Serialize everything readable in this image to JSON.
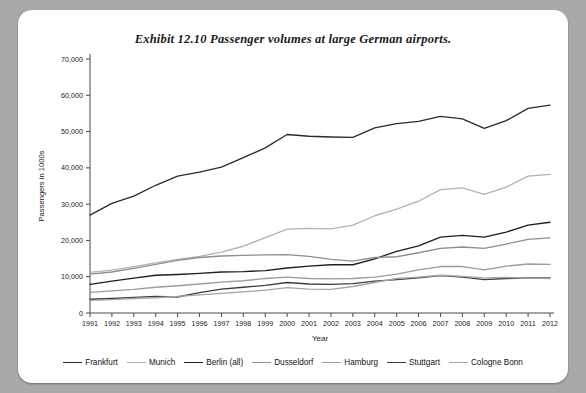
{
  "title": "Exhibit 12.10  Passenger volumes at large German airports.",
  "axes": {
    "xlabel": "Year",
    "ylabel": "Passengers in 1000s",
    "ytick_labels": [
      "0",
      "10,000",
      "20,000",
      "30,000",
      "40,000",
      "50,000",
      "60,000",
      "70,000"
    ],
    "xtick_labels": [
      "1991",
      "1992",
      "1993",
      "1994",
      "1995",
      "1996",
      "1997",
      "1998",
      "1999",
      "2000",
      "2001",
      "2002",
      "2003",
      "2004",
      "2005",
      "2006",
      "2007",
      "2008",
      "2009",
      "2010",
      "2011",
      "2012"
    ]
  },
  "chart_data": {
    "type": "line",
    "title": "Exhibit 12.10  Passenger volumes at large German airports.",
    "xlabel": "Year",
    "ylabel": "Passengers in 1000s",
    "xlim": [
      1991,
      2012
    ],
    "ylim": [
      0,
      70000
    ],
    "ytick_step": 10000,
    "grid": false,
    "legend_position": "bottom",
    "x": [
      1991,
      1992,
      1993,
      1994,
      1995,
      1996,
      1997,
      1998,
      1999,
      2000,
      2001,
      2002,
      2003,
      2004,
      2005,
      2006,
      2007,
      2008,
      2009,
      2010,
      2011,
      2012
    ],
    "series": [
      {
        "name": "Frankfurt",
        "color": "#2b2b2b",
        "values": [
          27000,
          30200,
          32200,
          35200,
          37700,
          38800,
          40200,
          42800,
          45500,
          49200,
          48700,
          48500,
          48400,
          51000,
          52200,
          52800,
          54200,
          53500,
          50900,
          53000,
          56400,
          57300
        ]
      },
      {
        "name": "Munich",
        "color": "#b3b3b3",
        "values": [
          11200,
          11800,
          12800,
          13800,
          14800,
          15600,
          16800,
          18400,
          20800,
          23100,
          23300,
          23200,
          24200,
          26800,
          28600,
          30800,
          34000,
          34500,
          32700,
          34700,
          37700,
          38200
        ]
      },
      {
        "name": "Berlin (all)",
        "color": "#1f1f1f",
        "values": [
          7900,
          8800,
          9600,
          10400,
          10600,
          10900,
          11300,
          11400,
          11700,
          12400,
          12900,
          13300,
          13300,
          14900,
          17000,
          18500,
          20900,
          21400,
          20900,
          22300,
          24200,
          25000
        ]
      },
      {
        "name": "Dusseldorf",
        "color": "#8f8f8f",
        "values": [
          10700,
          11300,
          12300,
          13400,
          14500,
          15300,
          15700,
          15900,
          16000,
          16100,
          15600,
          14800,
          14300,
          15300,
          15500,
          16600,
          17800,
          18200,
          17800,
          19000,
          20300,
          20700
        ]
      },
      {
        "name": "Hamburg",
        "color": "#9d9d9d",
        "values": [
          5700,
          6100,
          6500,
          7100,
          7500,
          8000,
          8500,
          8900,
          9500,
          9900,
          9500,
          9400,
          9500,
          9900,
          10700,
          11900,
          12800,
          12800,
          11900,
          12900,
          13500,
          13400
        ]
      },
      {
        "name": "Stuttgart",
        "color": "#3d3d3d",
        "values": [
          3800,
          4000,
          4300,
          4600,
          4400,
          5600,
          6600,
          7100,
          7600,
          8400,
          8000,
          7900,
          8100,
          8800,
          9200,
          9700,
          10300,
          9900,
          9200,
          9500,
          9700,
          9700
        ]
      },
      {
        "name": "Cologne Bonn",
        "color": "#a5a5a5",
        "values": [
          3500,
          3700,
          4000,
          4200,
          4600,
          5000,
          5400,
          5800,
          6300,
          7000,
          6600,
          6500,
          7300,
          8400,
          9500,
          9900,
          10400,
          10100,
          9700,
          9800,
          9600,
          9500
        ]
      }
    ]
  },
  "legend": {
    "items": [
      {
        "label": "Frankfurt",
        "color": "#2b2b2b"
      },
      {
        "label": "Munich",
        "color": "#b3b3b3"
      },
      {
        "label": "Berlin (all)",
        "color": "#1f1f1f"
      },
      {
        "label": "Dusseldorf",
        "color": "#8f8f8f"
      },
      {
        "label": "Hamburg",
        "color": "#9d9d9d"
      },
      {
        "label": "Stuttgart",
        "color": "#3d3d3d"
      },
      {
        "label": "Cologne Bonn",
        "color": "#a5a5a5"
      }
    ]
  }
}
